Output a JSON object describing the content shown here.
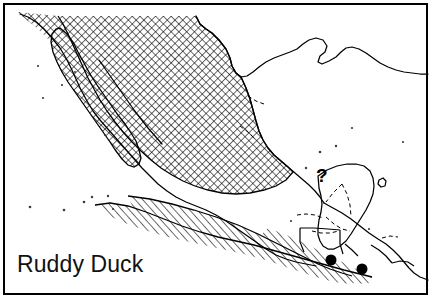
{
  "figure": {
    "kind": "range-map",
    "species_label": "Ruddy Duck",
    "frame": {
      "visible": true,
      "stroke_color": "#000000",
      "stroke_width": 2,
      "x": 3,
      "y": 3,
      "width": 425,
      "height": 292
    },
    "background_color": "#ffffff",
    "ink_color": "#000000",
    "region_depicted": "Mexico and Central America"
  },
  "annotations": {
    "uncertainty_marker": {
      "glyph": "?",
      "name": "question-mark-annotation",
      "x": 322,
      "y": 182,
      "meaning": "status uncertain"
    },
    "point_records": [
      {
        "label": "record-point-1",
        "cx": 331,
        "cy": 260,
        "r": 5.5,
        "color": "#000000"
      },
      {
        "label": "record-point-2",
        "cx": 362,
        "cy": 269,
        "r": 5.5,
        "color": "#000000"
      }
    ],
    "speckles": [
      {
        "cx": 38,
        "cy": 66
      },
      {
        "cx": 62,
        "cy": 85
      },
      {
        "cx": 43,
        "cy": 98
      },
      {
        "cx": 75,
        "cy": 72
      },
      {
        "cx": 30,
        "cy": 207
      },
      {
        "cx": 64,
        "cy": 210
      },
      {
        "cx": 84,
        "cy": 202
      },
      {
        "cx": 92,
        "cy": 197
      },
      {
        "cx": 108,
        "cy": 196
      },
      {
        "cx": 110,
        "cy": 203
      },
      {
        "cx": 113,
        "cy": 209
      },
      {
        "cx": 105,
        "cy": 135
      },
      {
        "cx": 320,
        "cy": 152
      },
      {
        "cx": 336,
        "cy": 146
      },
      {
        "cx": 306,
        "cy": 168
      },
      {
        "cx": 352,
        "cy": 128
      },
      {
        "cx": 291,
        "cy": 221
      },
      {
        "cx": 369,
        "cy": 229
      },
      {
        "cx": 403,
        "cy": 142
      }
    ]
  },
  "legend_patterns": {
    "crosshatch": {
      "name": "breeding-range-crosshatch",
      "description": "dense diagonal cross-hatching",
      "spacing_px": 5.5,
      "stroke_width": 1.1,
      "color": "#000000"
    },
    "diagonal": {
      "name": "wintering-range-diagonal-hatch",
      "description": "single-direction diagonal hatching",
      "spacing_px": 5.5,
      "stroke_width": 1.1,
      "color": "#000000"
    }
  },
  "geometry": {
    "coastline_mexico": "M 196 16 L 200 24 L 206 29 L 212 33 L 219 40 L 226 49 L 230 58 L 232 66 L 236 73 L 241 77 L 247 76 L 253 72 L 259 67 L 266 62 L 274 58 L 282 55 L 290 52 L 297 49 L 303 44 L 309 40 L 316 38 L 323 40 L 327 46 L 325 52 L 320 56 L 318 62 L 322 64 L 329 61 L 336 57 L 341 52 L 346 48 L 352 47 L 359 49 L 366 53 L 373 58 L 380 63 L 388 67 L 396 70 L 404 72 L 412 73 L 420 74 L 428 74",
    "gulf_coast_south": "M 241 77 L 246 88 L 250 99 L 253 110 L 256 121 L 259 131 L 263 140 L 268 148 L 274 155 L 281 161 L 288 167 L 295 173 L 302 179 L 309 185 L 315 191 L 320 197 L 324 203",
    "pacific_coast": "M 20 14 L 28 17 L 36 22 L 44 29 L 52 38 L 60 48 L 66 58 L 71 68 L 76 79 L 81 90 L 87 101 L 93 111 L 100 120 L 107 128 L 114 136 L 121 144 L 128 152 L 135 160 L 142 168 L 150 176 L 158 184 L 167 191 L 176 197 L 186 202 L 196 206 L 206 210 L 216 215 L 226 221 L 236 228 L 246 235 L 256 242 L 266 249 L 276 255 L 286 259 L 296 262 L 306 264 L 316 266",
    "baja_peninsula": "M 60 28 L 67 34 L 73 42 L 78 52 L 84 63 L 90 74 L 97 85 L 104 95 L 111 105 L 118 115 L 125 124 L 131 133 L 136 141 L 139 150 L 141 158 L 139 164 L 134 167 L 128 165 L 122 159 L 116 151 L 110 142 L 103 132 L 96 122 L 89 112 L 82 102 L 75 92 L 68 82 L 62 72 L 57 62 L 53 52 L 51 42 L 52 34 L 56 29 Z",
    "gulf_of_california": "M 99 60 L 106 70 L 113 80 L 120 90 L 127 100 L 134 110 L 141 119 L 148 128 L 155 136 L 162 144",
    "yucatan_peninsula": "M 318 176 L 327 170 L 337 166 L 347 164 L 356 164 L 364 166 L 370 171 L 373 178 L 374 186 L 373 194 L 370 202 L 366 210 L 361 218 L 356 226 L 351 234 L 346 241 L 340 246 L 334 249 L 328 249 L 323 246 L 320 241 L 318 235 L 318 228 L 319 220 L 321 212 L 322 204 L 321 196 L 319 188 Z",
    "central_america_coast": "M 324 203 L 333 208 L 342 213 L 351 219 L 360 226 L 369 233 L 378 239 L 386 244 L 393 250 L 399 256 L 404 262 L 409 268 L 414 273 L 420 277 L 428 280",
    "internal_borders": [
      "M 326 217 L 334 224 L 342 229 L 350 231",
      "M 342 184 L 347 194 L 350 205 L 351 216",
      "M 342 184 L 333 193 L 326 202",
      "M 297 215 L 306 214 L 315 215 L 323 218",
      "M 312 231 L 321 233 L 330 233 L 339 231",
      "M 300 229 L 300 240 L 303 249",
      "M 345 244 L 352 250 L 358 256",
      "M 382 238 L 390 236 L 398 237",
      "M 371 245 L 379 250 L 386 256 L 392 263",
      "M 248 96 L 256 101 L 264 104",
      "M 240 126 L 248 132 L 255 139"
    ]
  },
  "colors": {
    "ink": "#000000",
    "paper": "#ffffff",
    "frame": "#000000",
    "label_text": "#111111"
  }
}
